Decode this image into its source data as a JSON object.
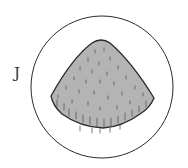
{
  "figure": {
    "label": "J",
    "colors": {
      "outline": "#2a2a2a",
      "fill": "#b4b4b4",
      "hatch": "#555555",
      "background": "#ffffff"
    },
    "circle": {
      "cx": 102,
      "cy": 87,
      "r": 71
    },
    "specimen": {
      "shape": "rounded-triangle-with-curved-base",
      "apex": [
        101,
        40
      ],
      "left_corner": [
        51,
        96
      ],
      "right_corner": [
        154,
        99
      ],
      "bottom": [
        103,
        128
      ]
    }
  }
}
